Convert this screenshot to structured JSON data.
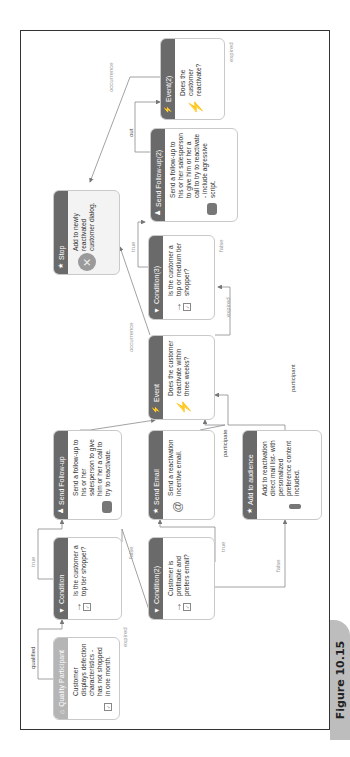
{
  "figure_label": "Figure 10.15",
  "nodes": {
    "quality_participant": {
      "title": "Quality Participant",
      "icon": "house-icon",
      "text": "Customer displays defection characteristics - has not shopped in one month."
    },
    "condition": {
      "title": "Condition",
      "icon": "filter-icon",
      "text": "Is the customer a top tier shopper?"
    },
    "send_followup": {
      "title": "Send Follow-up",
      "icon": "people-icon",
      "text": "Send a follow-up to his or her salesperson to give him or her a call to try to reactivate."
    },
    "condition2": {
      "title": "Condition(2)",
      "icon": "filter-icon",
      "text": "Customer is profitable and prefers email?"
    },
    "send_email": {
      "title": "Send Email",
      "icon": "star-icon",
      "text": "Send a reactivation incentive email."
    },
    "add_audience": {
      "title": "Add to audience",
      "icon": "star-icon",
      "text": "Add to reactivation direct mail list- with personalized preference content included."
    },
    "event": {
      "title": "Event",
      "icon": "lightning-icon",
      "text": "Does the customer reactivate within three weeks?"
    },
    "condition3": {
      "title": "Condition(3)",
      "icon": "filter-icon",
      "text": "Is the customer a top or medium tier shopper?"
    },
    "stop": {
      "title": "Stop",
      "icon": "star-icon",
      "text": "Add to newly reactivated customer dialog."
    },
    "send_followup2": {
      "title": "Send Follow-up(2)",
      "icon": "people-icon",
      "text": "Send a follow-up to his or her salesperson to give him or her a call to try to reactivate - include agressive script."
    },
    "event2": {
      "title": "Event(2)",
      "icon": "lightning-icon",
      "text": "Does the customer reactivate?"
    }
  },
  "edge_labels": {
    "qualified": "qualified",
    "expired_qp": "expired",
    "true_1": "true",
    "false_1": "false",
    "true_2": "true",
    "false_2": "false",
    "out_1": "out",
    "participate": "participate",
    "participant": "participant",
    "occurrence_1": "occurrence",
    "expired_event": "expired",
    "true_3": "true",
    "false_3": "false",
    "out_2": "out",
    "occurrence_2": "occurrence",
    "expired_event2": "expired"
  },
  "glyphs": {
    "filter": "▼",
    "lightning": "⚡",
    "star": "★",
    "people": "♟",
    "house": "⌂",
    "check": "✓",
    "x": "✕",
    "at": "@",
    "arrow_right": "→"
  },
  "colors": {
    "header_dark": "#6a6a6a",
    "header_light": "#b5b5b5",
    "edge": "#8a8a8a",
    "frame": "#333333",
    "tab": "#bdbdbd"
  }
}
